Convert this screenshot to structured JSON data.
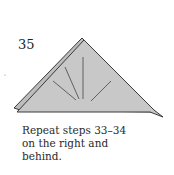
{
  "step": {
    "number": "35",
    "caption_lines": [
      "Repeat steps 33–34",
      "on the right and",
      "behind."
    ]
  },
  "colors": {
    "paper_fill": "#c8c8c8",
    "outline": "#3a3a3a"
  }
}
